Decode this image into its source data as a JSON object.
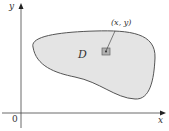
{
  "diagram": {
    "axes": {
      "x_label": "x",
      "y_label": "y",
      "origin_label": "0"
    },
    "region": {
      "label": "D",
      "fill": "#e4e4e4",
      "stroke": "#555555"
    },
    "point": {
      "label": "(x, y)",
      "box_fill": "#b0b0b0"
    }
  }
}
